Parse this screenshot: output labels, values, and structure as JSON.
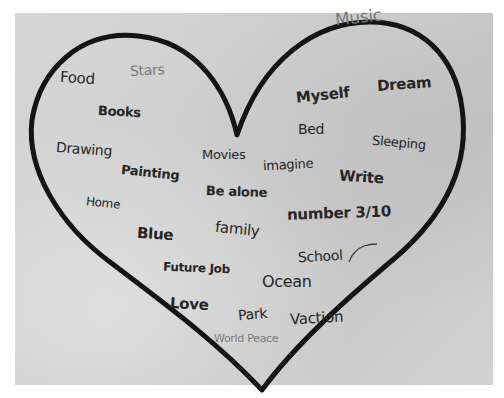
{
  "image": {
    "subject": "hand-drawn heart on paper filled with handwritten words",
    "colors": {
      "paper": "#d2d2d2",
      "background": "#ffffff",
      "outline": "#141414",
      "ink_dark": "#262626",
      "ink_light": "#7a7a7a"
    }
  },
  "words": [
    {
      "text": "Music",
      "shade": "light"
    },
    {
      "text": "Food",
      "shade": "dark"
    },
    {
      "text": "Stars",
      "shade": "light"
    },
    {
      "text": "Myself",
      "shade": "dark"
    },
    {
      "text": "Dream",
      "shade": "dark"
    },
    {
      "text": "Books",
      "shade": "dark"
    },
    {
      "text": "Bed",
      "shade": "dark"
    },
    {
      "text": "Sleeping",
      "shade": "dark"
    },
    {
      "text": "Drawing",
      "shade": "dark"
    },
    {
      "text": "Movies",
      "shade": "dark"
    },
    {
      "text": "imagine",
      "shade": "dark"
    },
    {
      "text": "Painting",
      "shade": "dark"
    },
    {
      "text": "Write",
      "shade": "dark"
    },
    {
      "text": "Be alone",
      "shade": "dark"
    },
    {
      "text": "Home",
      "shade": "dark"
    },
    {
      "text": "number 3/10",
      "shade": "dark"
    },
    {
      "text": "Blue",
      "shade": "dark"
    },
    {
      "text": "family",
      "shade": "dark"
    },
    {
      "text": "School",
      "shade": "dark"
    },
    {
      "text": "Future Job",
      "shade": "dark"
    },
    {
      "text": "Ocean",
      "shade": "dark"
    },
    {
      "text": "Love",
      "shade": "dark"
    },
    {
      "text": "Park",
      "shade": "dark"
    },
    {
      "text": "Vaction",
      "shade": "dark"
    },
    {
      "text": "World Peace",
      "shade": "light"
    }
  ]
}
